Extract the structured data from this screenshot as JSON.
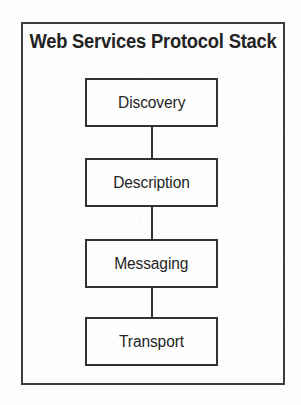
{
  "figure": {
    "title": "Web Services Protocol Stack",
    "colors": {
      "page_background": "#fdfdfd",
      "frame_border": "#3d3d3d",
      "box_border": "#333333",
      "box_fill": "#fefefe",
      "text": "#242424",
      "connector": "#333333"
    }
  },
  "diagram_data": {
    "type": "stack",
    "orientation": "vertical",
    "title": "Web Services Protocol Stack",
    "nodes": [
      {
        "id": "discovery",
        "label": "Discovery",
        "level": 1
      },
      {
        "id": "description",
        "label": "Description",
        "level": 2
      },
      {
        "id": "messaging",
        "label": "Messaging",
        "level": 3
      },
      {
        "id": "transport",
        "label": "Transport",
        "level": 4
      }
    ],
    "edges": [
      {
        "from": "discovery",
        "to": "description",
        "style": "plain-line"
      },
      {
        "from": "description",
        "to": "messaging",
        "style": "plain-line"
      },
      {
        "from": "messaging",
        "to": "transport",
        "style": "plain-line"
      }
    ]
  }
}
